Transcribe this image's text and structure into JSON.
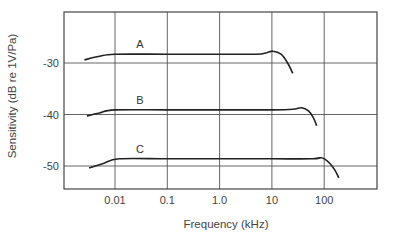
{
  "chart_data": {
    "type": "line",
    "title": "",
    "xlabel": "Frequency (kHz)",
    "ylabel": "Sensitivity (dB re 1V/Pa)",
    "xscale": "log",
    "xlim": [
      0.0011,
      1000
    ],
    "ylim": [
      -54.5,
      -20
    ],
    "grid": true,
    "legend": "inline labels",
    "x_ticks": [
      0.01,
      0.1,
      1.0,
      10,
      100
    ],
    "x_tick_labels": [
      "0.01",
      "0.1",
      "1.0",
      "10",
      "100"
    ],
    "y_ticks": [
      -30,
      -40,
      -50
    ],
    "y_tick_labels": [
      "-30",
      "-40",
      "-50"
    ],
    "series": [
      {
        "name": "A",
        "x": [
          0.0026,
          0.005,
          0.01,
          0.1,
          1.0,
          5.0,
          8.0,
          10.5,
          15,
          20,
          25
        ],
        "values": [
          -29.4,
          -28.7,
          -28.3,
          -28.3,
          -28.3,
          -28.3,
          -28.0,
          -27.7,
          -28.3,
          -30.0,
          -32.0
        ]
      },
      {
        "name": "B",
        "x": [
          0.0029,
          0.005,
          0.01,
          0.1,
          1.0,
          10,
          25,
          37,
          50,
          62,
          72
        ],
        "values": [
          -40.3,
          -39.7,
          -39.1,
          -39.1,
          -39.1,
          -39.1,
          -39.0,
          -38.7,
          -39.3,
          -40.6,
          -42.2
        ]
      },
      {
        "name": "C",
        "x": [
          0.0032,
          0.006,
          0.012,
          0.1,
          1.0,
          10,
          60,
          90,
          120,
          160,
          190
        ],
        "values": [
          -50.4,
          -49.5,
          -48.6,
          -48.6,
          -48.6,
          -48.6,
          -48.6,
          -48.4,
          -49.2,
          -50.8,
          -52.3
        ]
      }
    ]
  },
  "colors": {
    "curve": "#222222",
    "grid": "#555555",
    "text": "#444444"
  }
}
